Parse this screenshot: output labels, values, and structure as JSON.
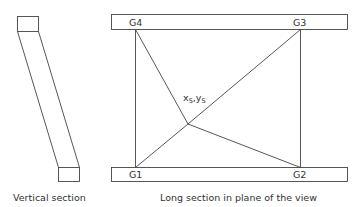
{
  "diagram": {
    "left_panel": {
      "caption": "Vertical section"
    },
    "right_panel": {
      "caption": "Long section in plane of the view",
      "points": {
        "g4": "G4",
        "g3": "G3",
        "g1": "G1",
        "g2": "G2",
        "center": "x",
        "center_sub": "S",
        "center_sep": ",",
        "center_y": "y",
        "center_y_sub": "S"
      }
    },
    "colors": {
      "line": "#444444",
      "text": "#333333",
      "background": "#ffffff"
    }
  }
}
